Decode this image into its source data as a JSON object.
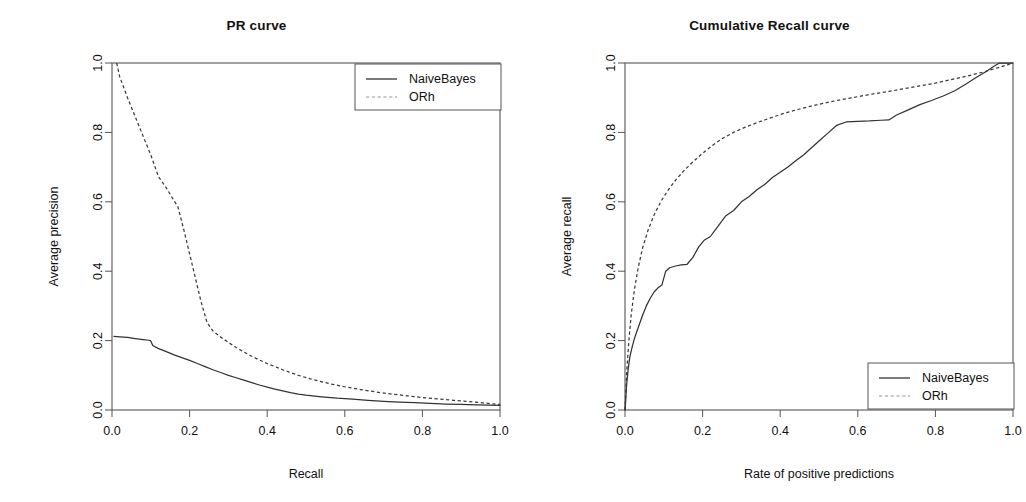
{
  "figure": {
    "width": 1026,
    "height": 502,
    "background": "#ffffff",
    "panel_count": 2
  },
  "colors": {
    "axis": "#555555",
    "text": "#111111",
    "naivebayes": "#333333",
    "orh": "#3a3a3a",
    "legend_border": "#555555",
    "legend_dashed_key": "#b9b9b9"
  },
  "chart_data": [
    {
      "id": "pr-curve",
      "type": "line",
      "title": "PR curve",
      "xlabel": "Recall",
      "ylabel": "Average precision",
      "xlim": [
        0.0,
        1.0
      ],
      "ylim": [
        0.0,
        1.0
      ],
      "xticks": [
        0.0,
        0.2,
        0.4,
        0.6,
        0.8,
        1.0
      ],
      "yticks": [
        0.0,
        0.2,
        0.4,
        0.6,
        0.8,
        1.0
      ],
      "xtick_labels": [
        "0.0",
        "0.2",
        "0.4",
        "0.6",
        "0.8",
        "1.0"
      ],
      "ytick_labels": [
        "0.0",
        "0.2",
        "0.4",
        "0.6",
        "0.8",
        "1.0"
      ],
      "grid": false,
      "legend_position": "top-right",
      "series": [
        {
          "name": "NaiveBayes",
          "style": "solid",
          "color": "#333333",
          "x": [
            0.005,
            0.02,
            0.04,
            0.06,
            0.08,
            0.095,
            0.1,
            0.105,
            0.12,
            0.14,
            0.16,
            0.18,
            0.2,
            0.22,
            0.24,
            0.26,
            0.28,
            0.3,
            0.32,
            0.34,
            0.36,
            0.38,
            0.4,
            0.42,
            0.44,
            0.46,
            0.48,
            0.5,
            0.54,
            0.58,
            0.62,
            0.66,
            0.7,
            0.74,
            0.78,
            0.82,
            0.86,
            0.9,
            0.94,
            0.97,
            1.0
          ],
          "y": [
            0.212,
            0.211,
            0.209,
            0.206,
            0.203,
            0.201,
            0.199,
            0.186,
            0.177,
            0.168,
            0.159,
            0.151,
            0.143,
            0.134,
            0.125,
            0.116,
            0.108,
            0.1,
            0.093,
            0.086,
            0.079,
            0.072,
            0.066,
            0.06,
            0.055,
            0.05,
            0.046,
            0.043,
            0.038,
            0.034,
            0.031,
            0.028,
            0.025,
            0.023,
            0.021,
            0.019,
            0.017,
            0.016,
            0.015,
            0.014,
            0.013
          ]
        },
        {
          "name": "ORh",
          "style": "dashed",
          "color": "#3a3a3a",
          "x": [
            0.012,
            0.02,
            0.04,
            0.06,
            0.08,
            0.1,
            0.12,
            0.14,
            0.155,
            0.17,
            0.185,
            0.2,
            0.215,
            0.23,
            0.245,
            0.26,
            0.28,
            0.3,
            0.32,
            0.34,
            0.36,
            0.38,
            0.4,
            0.44,
            0.48,
            0.52,
            0.56,
            0.6,
            0.64,
            0.68,
            0.72,
            0.76,
            0.8,
            0.84,
            0.88,
            0.92,
            0.96,
            1.0
          ],
          "y": [
            1.0,
            0.96,
            0.9,
            0.845,
            0.79,
            0.735,
            0.672,
            0.64,
            0.612,
            0.585,
            0.52,
            0.45,
            0.38,
            0.31,
            0.252,
            0.228,
            0.21,
            0.195,
            0.18,
            0.167,
            0.155,
            0.144,
            0.134,
            0.116,
            0.1,
            0.087,
            0.076,
            0.067,
            0.059,
            0.052,
            0.046,
            0.041,
            0.036,
            0.032,
            0.028,
            0.024,
            0.02,
            0.016
          ]
        }
      ],
      "legend": [
        {
          "label": "NaiveBayes",
          "style": "solid"
        },
        {
          "label": "ORh",
          "style": "dashed"
        }
      ]
    },
    {
      "id": "cumulative-recall-curve",
      "type": "line",
      "title": "Cumulative Recall curve",
      "xlabel": "Rate of positive predictions",
      "ylabel": "Average recall",
      "xlim": [
        0.0,
        1.0
      ],
      "ylim": [
        0.0,
        1.0
      ],
      "xticks": [
        0.0,
        0.2,
        0.4,
        0.6,
        0.8,
        1.0
      ],
      "yticks": [
        0.0,
        0.2,
        0.4,
        0.6,
        0.8,
        1.0
      ],
      "xtick_labels": [
        "0.0",
        "0.2",
        "0.4",
        "0.6",
        "0.8",
        "1.0"
      ],
      "ytick_labels": [
        "0.0",
        "0.2",
        "0.4",
        "0.6",
        "0.8",
        "1.0"
      ],
      "grid": false,
      "legend_position": "bottom-right",
      "series": [
        {
          "name": "NaiveBayes",
          "style": "solid",
          "color": "#333333",
          "x": [
            0.0,
            0.002,
            0.004,
            0.008,
            0.012,
            0.018,
            0.024,
            0.03,
            0.038,
            0.046,
            0.055,
            0.065,
            0.075,
            0.085,
            0.095,
            0.105,
            0.115,
            0.13,
            0.145,
            0.16,
            0.175,
            0.19,
            0.205,
            0.22,
            0.24,
            0.26,
            0.28,
            0.3,
            0.32,
            0.34,
            0.36,
            0.38,
            0.4,
            0.42,
            0.44,
            0.46,
            0.48,
            0.5,
            0.52,
            0.545,
            0.57,
            0.6,
            0.63,
            0.66,
            0.68,
            0.7,
            0.73,
            0.76,
            0.79,
            0.82,
            0.85,
            0.88,
            0.905,
            0.93,
            0.95,
            0.965,
            0.98,
            1.0
          ],
          "y": [
            0.0,
            0.03,
            0.07,
            0.115,
            0.15,
            0.18,
            0.205,
            0.225,
            0.25,
            0.275,
            0.3,
            0.322,
            0.34,
            0.352,
            0.36,
            0.4,
            0.41,
            0.415,
            0.418,
            0.42,
            0.44,
            0.47,
            0.49,
            0.5,
            0.53,
            0.56,
            0.575,
            0.6,
            0.615,
            0.635,
            0.65,
            0.67,
            0.685,
            0.7,
            0.718,
            0.735,
            0.755,
            0.775,
            0.795,
            0.82,
            0.83,
            0.832,
            0.833,
            0.835,
            0.836,
            0.85,
            0.865,
            0.88,
            0.892,
            0.905,
            0.92,
            0.94,
            0.958,
            0.975,
            0.99,
            1.0,
            1.0,
            1.0
          ]
        },
        {
          "name": "ORh",
          "style": "dashed",
          "color": "#3a3a3a",
          "x": [
            0.0,
            0.002,
            0.005,
            0.01,
            0.016,
            0.024,
            0.034,
            0.046,
            0.06,
            0.075,
            0.092,
            0.11,
            0.13,
            0.152,
            0.175,
            0.2,
            0.225,
            0.25,
            0.28,
            0.31,
            0.34,
            0.375,
            0.41,
            0.445,
            0.48,
            0.52,
            0.56,
            0.6,
            0.64,
            0.68,
            0.72,
            0.76,
            0.8,
            0.84,
            0.88,
            0.92,
            0.96,
            1.0
          ],
          "y": [
            0.0,
            0.055,
            0.12,
            0.2,
            0.275,
            0.345,
            0.41,
            0.47,
            0.52,
            0.562,
            0.6,
            0.632,
            0.662,
            0.69,
            0.715,
            0.74,
            0.762,
            0.782,
            0.8,
            0.815,
            0.828,
            0.842,
            0.855,
            0.866,
            0.876,
            0.886,
            0.895,
            0.903,
            0.911,
            0.918,
            0.926,
            0.934,
            0.942,
            0.952,
            0.962,
            0.973,
            0.986,
            1.0
          ]
        }
      ],
      "legend": [
        {
          "label": "NaiveBayes",
          "style": "solid"
        },
        {
          "label": "ORh",
          "style": "dashed"
        }
      ]
    }
  ]
}
